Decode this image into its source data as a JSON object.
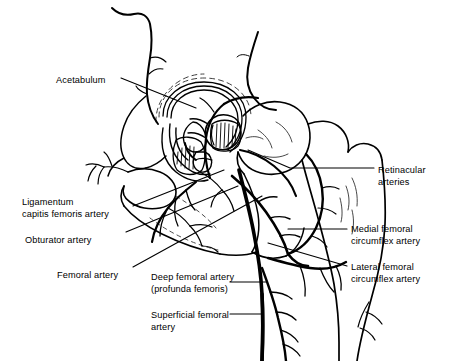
{
  "figure": {
    "background_color": "#ffffff",
    "ink_color": "#000000",
    "width": 458,
    "height": 361
  },
  "labels": {
    "acetabulum": {
      "text": "Acetabulum",
      "x": 56,
      "y": 74
    },
    "ligamentum_line1": {
      "text": "Ligamentum",
      "x": 22,
      "y": 196
    },
    "ligamentum_line2": {
      "text": "capitis femoris artery",
      "x": 22,
      "y": 208
    },
    "obturator": {
      "text": "Obturator artery",
      "x": 25,
      "y": 234
    },
    "femoral": {
      "text": "Femoral artery",
      "x": 57,
      "y": 269
    },
    "deep_line1": {
      "text": "Deep femoral artery",
      "x": 151,
      "y": 271
    },
    "deep_line2": {
      "text": "(profunda femoris)",
      "x": 151,
      "y": 283
    },
    "superficial_line1": {
      "text": "Superficial femoral",
      "x": 151,
      "y": 309
    },
    "superficial_line2": {
      "text": "artery",
      "x": 151,
      "y": 321
    },
    "retinacular_line1": {
      "text": "Retinacular",
      "x": 378,
      "y": 164
    },
    "retinacular_line2": {
      "text": "arteries",
      "x": 378,
      "y": 176
    },
    "medial_line1": {
      "text": "Medial femoral",
      "x": 351,
      "y": 223
    },
    "medial_line2": {
      "text": "circumflex artery",
      "x": 351,
      "y": 235
    },
    "lateral_line1": {
      "text": "Lateral femoral",
      "x": 351,
      "y": 261
    },
    "lateral_line2": {
      "text": "circumflex artery",
      "x": 351,
      "y": 273
    }
  }
}
